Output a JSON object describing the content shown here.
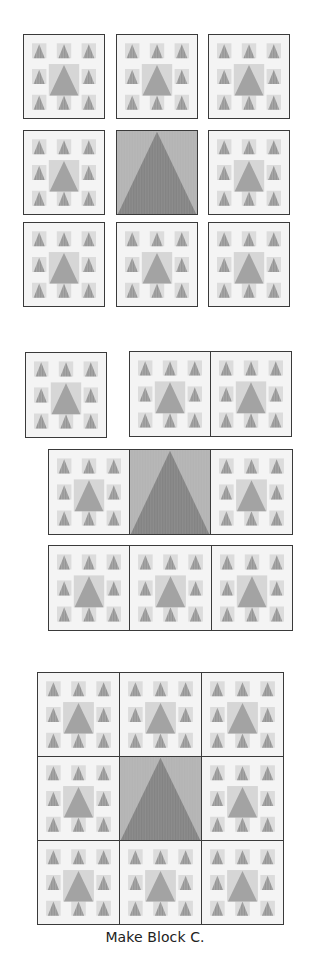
{
  "figure": {
    "caption": "Make Block C.",
    "colors": {
      "background": "#ffffff",
      "block_light": "#f4f4f4",
      "small_square": "#dcdcdc",
      "small_triangle": "#a8a8a8",
      "center_square": "#d6d6d6",
      "center_triangle": "#a3a3a3",
      "dark_square": "#b4b4b4",
      "dark_triangle": "#8d8d8d",
      "outline": "#3a3a3a"
    },
    "block_types": {
      "light": "light block with 8 small triangle-in-square units around a larger center triangle-in-square",
      "dark": "dark block with a single large triangle spanning the full square"
    },
    "step1": {
      "label": "Separate blocks laid out in 3x3",
      "blocks": [
        {
          "row": 1,
          "col": 1,
          "type": "light"
        },
        {
          "row": 1,
          "col": 2,
          "type": "light"
        },
        {
          "row": 1,
          "col": 3,
          "type": "light"
        },
        {
          "row": 2,
          "col": 1,
          "type": "light"
        },
        {
          "row": 2,
          "col": 2,
          "type": "dark"
        },
        {
          "row": 2,
          "col": 3,
          "type": "light"
        },
        {
          "row": 3,
          "col": 1,
          "type": "light"
        },
        {
          "row": 3,
          "col": 2,
          "type": "light"
        },
        {
          "row": 3,
          "col": 3,
          "type": "light"
        }
      ]
    },
    "step2": {
      "label": "Blocks joined into rows",
      "rows": [
        {
          "row": 1,
          "joined": "1 separate + 2 joined"
        },
        {
          "row": 2,
          "joined": "3 joined",
          "center": "dark"
        },
        {
          "row": 3,
          "joined": "3 joined"
        }
      ]
    },
    "step3": {
      "label": "Rows joined into Block C",
      "grid": "3x3",
      "center": "dark"
    }
  }
}
